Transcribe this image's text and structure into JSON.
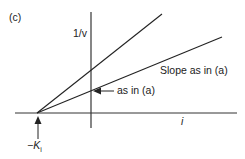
{
  "figure": {
    "panel_label": "(c)",
    "y_axis_label": "1/v",
    "x_axis_label": "i",
    "intercept_label_prefix": "−K",
    "intercept_label_subscript": "i",
    "line_label_upper": "Slope as in (a)",
    "arrow_label": "as in (a)"
  },
  "colors": {
    "line": "#222222",
    "background": "#ffffff"
  }
}
